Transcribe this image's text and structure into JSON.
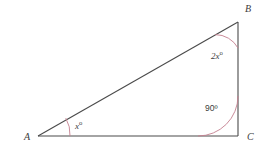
{
  "figure": {
    "kind": "geometry-diagram",
    "shape": "right-triangle",
    "background_color": "#ffffff",
    "line_color": "#4a4a4a",
    "arc_color": "#c47f8e",
    "text_color": "#3c3c3c",
    "vertices": [
      {
        "name": "A",
        "label": "A",
        "x": 38,
        "y": 136
      },
      {
        "name": "B",
        "label": "B",
        "x": 238,
        "y": 22
      },
      {
        "name": "C",
        "label": "C",
        "x": 238,
        "y": 136
      }
    ],
    "sides": [
      {
        "name": "AB",
        "from": "A",
        "to": "B"
      },
      {
        "name": "BC",
        "from": "B",
        "to": "C"
      },
      {
        "name": "AC",
        "from": "A",
        "to": "C"
      }
    ],
    "angles": [
      {
        "at": "A",
        "value": "x",
        "label": "x",
        "degree_symbol": "o",
        "arc_radius": 32
      },
      {
        "at": "B",
        "value": "2x",
        "label": "2x",
        "degree_symbol": "o",
        "arc_radius": 26
      },
      {
        "at": "C",
        "value": "90",
        "label": "90",
        "degree_symbol": "o",
        "arc_radius": 40
      }
    ]
  },
  "labels": {
    "vertex_a": "A",
    "vertex_b": "B",
    "vertex_c": "C",
    "angle_a_value": "x",
    "angle_a_degree": "o",
    "angle_b_value": "2x",
    "angle_b_degree": "o",
    "angle_c_value": "90",
    "angle_c_degree": "º"
  }
}
